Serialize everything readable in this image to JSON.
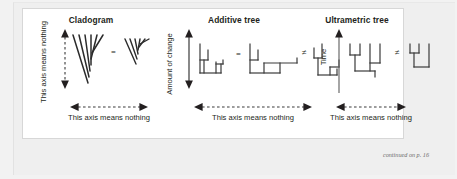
{
  "figure": {
    "caption_note": "continued on p. 16",
    "panels": [
      {
        "id": "cladogram",
        "title": "Cladogram",
        "y_axis_label": "This axis means nothing",
        "y_axis_style": "dashed-double-arrow",
        "x_axis_label": "This axis means nothing",
        "x_axis_style": "dashed-double-arrow",
        "relation_symbol": "=",
        "trees": [
          {
            "name": "cladogram-tree-left",
            "style": "slanted-v",
            "tips": 5
          },
          {
            "name": "cladogram-tree-right",
            "style": "slanted-v",
            "tips": 5
          }
        ]
      },
      {
        "id": "additive-tree",
        "title": "Additive tree",
        "y_axis_label": "Amount of change",
        "y_axis_style": "solid-double-arrow",
        "x_axis_label": "This axis means nothing",
        "x_axis_style": "dashed-double-arrow",
        "relation_symbol_1": "=",
        "relation_symbol_2": "≠",
        "trees": [
          {
            "name": "additive-tree-1",
            "style": "rectangular",
            "tips": 4
          },
          {
            "name": "additive-tree-2",
            "style": "rectangular",
            "tips": 4
          },
          {
            "name": "additive-tree-3",
            "style": "rectangular",
            "tips": 4
          }
        ]
      },
      {
        "id": "ultrametric-tree",
        "title": "Ultrametric tree",
        "y_axis_label": "Time",
        "y_axis_style": "solid-single-arrow-up",
        "x_axis_label": "This axis means nothing",
        "x_axis_style": "dashed-double-arrow",
        "relation_symbol": "≠",
        "trees": [
          {
            "name": "ultrametric-tree-left",
            "style": "rectangular-aligned-tips",
            "tips": 4
          },
          {
            "name": "ultrametric-tree-right",
            "style": "rectangular-aligned-tips",
            "tips": 3
          }
        ]
      }
    ]
  },
  "colors": {
    "ink": "#231f20",
    "line": "#3a3a3a",
    "panel_background": "#ffffff",
    "page_background": "#efefef",
    "panel_border": "#d7d7d7",
    "note_text": "#6d6d6d"
  }
}
